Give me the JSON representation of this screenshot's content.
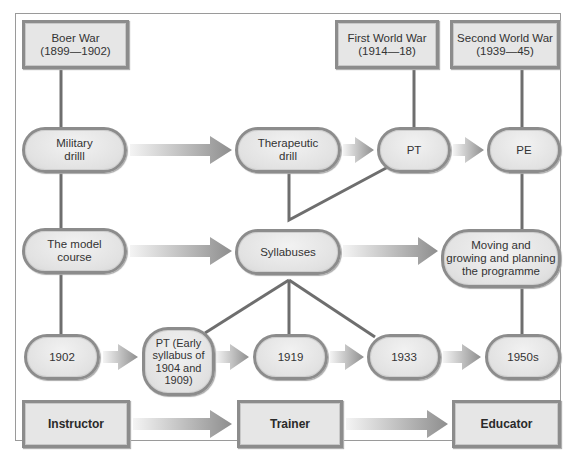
{
  "diagram": {
    "title": "",
    "wars": [
      {
        "id": "boer-war",
        "label": "Boer War\n(1899—1902)"
      },
      {
        "id": "first-world-war",
        "label": "First World War\n(1914—18)"
      },
      {
        "id": "second-world-war",
        "label": "Second World War\n(1939—45)"
      }
    ],
    "row1": [
      {
        "id": "military-drill",
        "label": "Military\ndrilll"
      },
      {
        "id": "therapeutic-drill",
        "label": "Therapeutic\ndrill"
      },
      {
        "id": "pt",
        "label": "PT"
      },
      {
        "id": "pe",
        "label": "PE"
      }
    ],
    "row2": [
      {
        "id": "model-course",
        "label": "The model\ncourse"
      },
      {
        "id": "syllabuses",
        "label": "Syllabuses"
      },
      {
        "id": "moving-growing",
        "label": "Moving and\ngrowing and planning\nthe programme"
      }
    ],
    "row3": [
      {
        "id": "y1902",
        "label": "1902"
      },
      {
        "id": "pt-early",
        "label": "PT (Early\nsyllabus of\n1904 and\n1909)"
      },
      {
        "id": "y1919",
        "label": "1919"
      },
      {
        "id": "y1933",
        "label": "1933"
      },
      {
        "id": "y1950s",
        "label": "1950s"
      }
    ],
    "roles": [
      {
        "id": "instructor",
        "label": "Instructor"
      },
      {
        "id": "trainer",
        "label": "Trainer"
      },
      {
        "id": "educator",
        "label": "Educator"
      }
    ],
    "colors": {
      "node_fill": "#e6e6e6",
      "node_border": "#8c8c8c",
      "connector": "#6e6e6e",
      "arrow_dark": "#8a8a8a",
      "arrow_light": "#eeeeee"
    }
  }
}
